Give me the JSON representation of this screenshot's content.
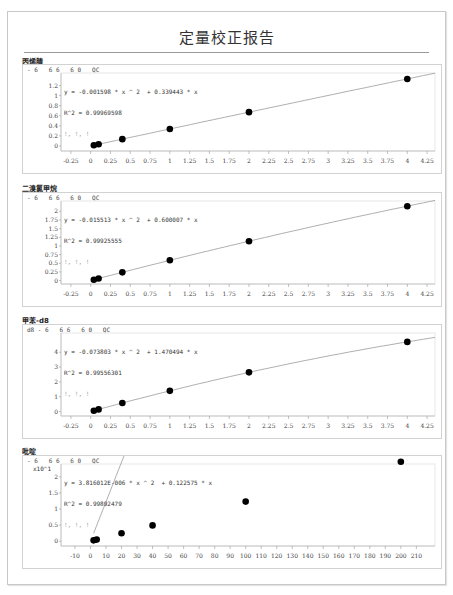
{
  "report": {
    "title": "定量校正报告"
  },
  "sections": [
    {
      "name": "丙烯腈",
      "header": "- 6   6 6   6 0   QC",
      "equation": "y = -0.001598 * x ^ 2  + 0.339443 * x",
      "r2": "R^2 = 0.99969598",
      "extra": "!, !, !"
    },
    {
      "name": "二溴氯甲烷",
      "header": "- 6   6 6   6 0   QC",
      "equation": "y = -0.015513 * x ^ 2  + 0.600007 * x",
      "r2": "R^2 = 0.99925555",
      "extra": "!, !, !"
    },
    {
      "name": "甲苯-d8",
      "header": "d8 - 6   6 6   6 0   QC",
      "equation": "y = -0.073803 * x ^ 2  + 1.470494 * x",
      "r2": "R^2 = 0.99556301",
      "extra": "!, !, !"
    },
    {
      "name": "吡啶",
      "header": "- 6   6 6   6 0   QC",
      "equation": "y = 3.816012E-006 * x ^ 2  + 0.122575 * x",
      "r2": "R^2 = 0.99892479",
      "extra": "!, !, !",
      "y_multiplier": "x10^1"
    }
  ],
  "chart_data": [
    {
      "type": "scatter",
      "title": "丙烯腈",
      "fit": "quadratic",
      "fit_coefficients": {
        "a": -0.001598,
        "b": 0.339443
      },
      "r_squared": 0.99969598,
      "x": [
        0.04,
        0.1,
        0.4,
        1,
        2,
        4
      ],
      "y": [
        0.014,
        0.034,
        0.135,
        0.338,
        0.672,
        1.332
      ],
      "xlim": [
        -0.375,
        4.35
      ],
      "ylim": [
        -0.1,
        1.45
      ],
      "xticks": [
        "-0.25",
        "0",
        "0.25",
        "0.5",
        "0.75",
        "1",
        "1.25",
        "1.5",
        "1.75",
        "2",
        "2.25",
        "2.5",
        "2.75",
        "3",
        "3.25",
        "3.5",
        "3.75",
        "4",
        "4.25"
      ],
      "yticks": [
        "0",
        "0.2",
        "0.4",
        "0.6",
        "0.8",
        "1",
        "1.2"
      ],
      "grid": false
    },
    {
      "type": "scatter",
      "title": "二溴氯甲烷",
      "fit": "quadratic",
      "fit_coefficients": {
        "a": -0.015513,
        "b": 0.600007
      },
      "r_squared": 0.99925555,
      "x": [
        0.04,
        0.1,
        0.4,
        1,
        2,
        4
      ],
      "y": [
        0.024,
        0.06,
        0.237,
        0.585,
        1.138,
        2.15
      ],
      "xlim": [
        -0.375,
        4.35
      ],
      "ylim": [
        -0.1,
        2.3
      ],
      "xticks": [
        "-0.25",
        "0",
        "0.25",
        "0.5",
        "0.75",
        "1",
        "1.25",
        "1.5",
        "1.75",
        "2",
        "2.25",
        "2.5",
        "2.75",
        "3",
        "3.25",
        "3.5",
        "3.75",
        "4",
        "4.25"
      ],
      "yticks": [
        "0",
        "0.25",
        "0.5",
        "0.75",
        "1",
        "1.25",
        "1.5",
        "1.75",
        "2"
      ],
      "grid": false
    },
    {
      "type": "scatter",
      "title": "甲苯-d8",
      "fit": "quadratic",
      "fit_coefficients": {
        "a": -0.073803,
        "b": 1.470494
      },
      "r_squared": 0.99556301,
      "x": [
        0.04,
        0.1,
        0.4,
        1,
        2,
        4
      ],
      "y": [
        0.059,
        0.146,
        0.576,
        1.397,
        2.646,
        4.7
      ],
      "xlim": [
        -0.375,
        4.35
      ],
      "ylim": [
        -0.3,
        5.3
      ],
      "xticks": [
        "-0.25",
        "0",
        "0.25",
        "0.5",
        "0.75",
        "1",
        "1.25",
        "1.5",
        "1.75",
        "2",
        "2.25",
        "2.5",
        "2.75",
        "3",
        "3.25",
        "3.5",
        "3.75",
        "4",
        "4.25"
      ],
      "yticks": [
        "0",
        "1",
        "2",
        "3",
        "4"
      ],
      "grid": false
    },
    {
      "type": "scatter",
      "title": "吡啶",
      "fit": "quadratic",
      "fit_coefficients": {
        "a": 3.816012e-06,
        "b": 0.122575
      },
      "r_squared": 0.99892479,
      "ylabel": "x10^1",
      "x": [
        2,
        4,
        20,
        40,
        100,
        200
      ],
      "y": [
        0.025,
        0.049,
        0.245,
        0.49,
        1.23,
        2.47
      ],
      "xlim": [
        -19,
        222
      ],
      "ylim": [
        -0.15,
        2.4
      ],
      "xticks": [
        "-10",
        "0",
        "10",
        "20",
        "30",
        "40",
        "50",
        "60",
        "70",
        "80",
        "90",
        "100",
        "110",
        "120",
        "130",
        "140",
        "150",
        "160",
        "170",
        "180",
        "190",
        "200",
        "210"
      ],
      "yticks": [
        "0",
        "0.5",
        "1",
        "1.5",
        "2"
      ],
      "grid": false
    }
  ]
}
